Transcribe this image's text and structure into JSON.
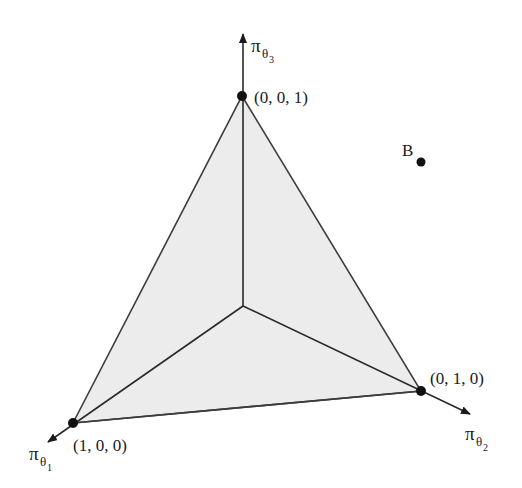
{
  "diagram": {
    "type": "probability-simplex-3d",
    "colors": {
      "background": "#ffffff",
      "simplex_fill": "#ececec",
      "edge_stroke": "#3c3c3c",
      "point": "#111111"
    },
    "axes": [
      {
        "id": "theta1",
        "symbol": "π",
        "subscript": "θ",
        "subsub": "1"
      },
      {
        "id": "theta2",
        "symbol": "π",
        "subscript": "θ",
        "subsub": "2"
      },
      {
        "id": "theta3",
        "symbol": "π",
        "subscript": "θ",
        "subsub": "3"
      }
    ],
    "vertices": [
      {
        "label": "(1, 0, 0)"
      },
      {
        "label": "(0, 1, 0)"
      },
      {
        "label": "(0, 0, 1)"
      }
    ],
    "points": [
      {
        "label": "B"
      }
    ]
  }
}
